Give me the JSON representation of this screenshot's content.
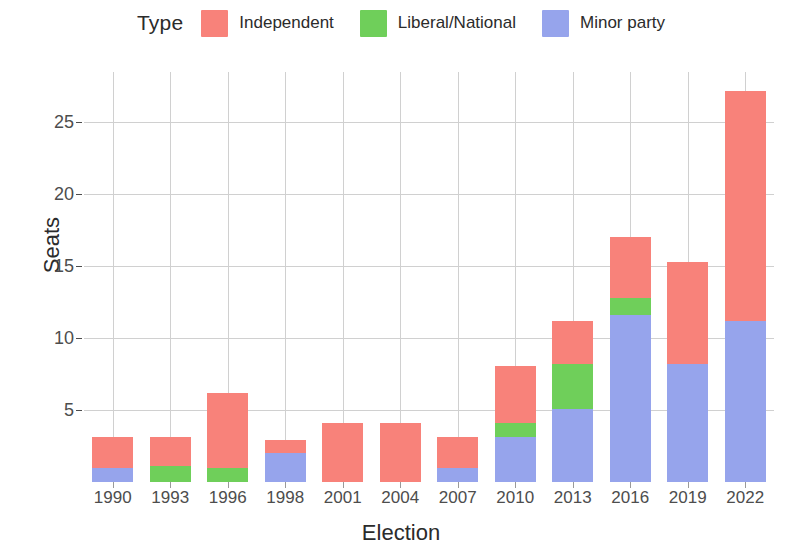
{
  "legend": {
    "title": "Type",
    "items": [
      {
        "label": "Independent",
        "color": "#F8827A",
        "key_name": "legend-key-independent"
      },
      {
        "label": "Liberal/National",
        "color": "#6FCF5A",
        "key_name": "legend-key-liberal-national"
      },
      {
        "label": "Minor party",
        "color": "#96A4EC",
        "key_name": "legend-key-minor-party"
      }
    ]
  },
  "chart_data": {
    "type": "bar",
    "stacked": true,
    "title": "",
    "xlabel": "Election",
    "ylabel": "Seats",
    "categories": [
      "1990",
      "1993",
      "1996",
      "1998",
      "2001",
      "2004",
      "2007",
      "2010",
      "2013",
      "2016",
      "2019",
      "2022"
    ],
    "series": [
      {
        "name": "Minor party",
        "color": "#96A4EC",
        "values": [
          1.0,
          0.0,
          0.0,
          2.0,
          0.0,
          0.0,
          1.0,
          3.1,
          5.1,
          11.6,
          8.2,
          11.2
        ]
      },
      {
        "name": "Liberal/National",
        "color": "#6FCF5A",
        "values": [
          0.0,
          1.1,
          1.0,
          0.0,
          0.0,
          0.0,
          0.0,
          1.0,
          3.1,
          1.2,
          0.0,
          0.0
        ]
      },
      {
        "name": "Independent",
        "color": "#F8827A",
        "values": [
          2.1,
          2.0,
          5.2,
          0.9,
          4.1,
          4.1,
          2.1,
          4.0,
          3.0,
          4.2,
          7.1,
          16.0
        ]
      }
    ],
    "totals": [
      3.1,
      3.1,
      6.2,
      2.9,
      4.1,
      4.1,
      3.1,
      8.1,
      11.2,
      17.0,
      15.3,
      27.2
    ],
    "stack_order": [
      "Independent",
      "Liberal/National",
      "Minor party"
    ],
    "ylim": [
      0,
      28.5
    ],
    "y_ticks": [
      5,
      10,
      15,
      20,
      25
    ],
    "y_tick_labels": [
      "5",
      "10",
      "15",
      "20",
      "25"
    ],
    "grid": {
      "horizontal": true,
      "vertical": true
    },
    "legend_position": "top"
  }
}
